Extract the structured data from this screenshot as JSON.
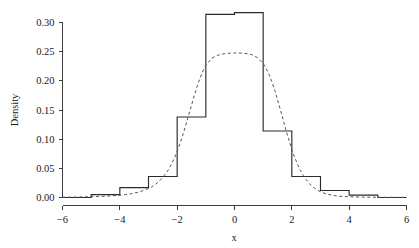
{
  "chart_data": {
    "type": "bar",
    "title": "",
    "subtitle": "",
    "xlabel": "x",
    "ylabel": "Density",
    "xlim": [
      -6,
      6
    ],
    "ylim": [
      0,
      0.33
    ],
    "grid": false,
    "legend": null,
    "xticks": [
      "−6",
      "−4",
      "−2",
      "0",
      "2",
      "4",
      "6"
    ],
    "xtick_values": [
      -6,
      -4,
      -2,
      0,
      2,
      4,
      6
    ],
    "yticks": [
      "0.00",
      "0.05",
      "0.10",
      "0.15",
      "0.20",
      "0.25",
      "0.30"
    ],
    "ytick_values": [
      0.0,
      0.05,
      0.1,
      0.15,
      0.2,
      0.25,
      0.3
    ],
    "histogram": {
      "name": "Density histogram",
      "bin_width": 1,
      "bin_edges": [
        -6,
        -5,
        -4,
        -3,
        -2,
        -1,
        0,
        1,
        2,
        3,
        4,
        5,
        6
      ],
      "bin_centers": [
        -5.5,
        -4.5,
        -3.5,
        -2.5,
        -1.5,
        -0.5,
        0.5,
        1.5,
        2.5,
        3.5,
        4.5,
        5.5
      ],
      "values": [
        0.0,
        0.005,
        0.017,
        0.036,
        0.138,
        0.314,
        0.317,
        0.114,
        0.036,
        0.012,
        0.004,
        0.0
      ]
    },
    "curve": {
      "name": "Fitted density curve",
      "style": "dashed",
      "peak_value": 0.248,
      "x": [
        -6.0,
        -5.5,
        -5.0,
        -4.5,
        -4.0,
        -3.8,
        -3.6,
        -3.4,
        -3.2,
        -3.0,
        -2.9,
        -2.8,
        -2.7,
        -2.6,
        -2.5,
        -2.4,
        -2.3,
        -2.2,
        -2.1,
        -2.0,
        -1.9,
        -1.8,
        -1.7,
        -1.6,
        -1.5,
        -1.4,
        -1.3,
        -1.2,
        -1.1,
        -1.0,
        -0.8,
        -0.6,
        -0.4,
        -0.2,
        0.0,
        0.2,
        0.4,
        0.6,
        0.8,
        1.0,
        1.1,
        1.2,
        1.3,
        1.4,
        1.5,
        1.6,
        1.7,
        1.8,
        1.9,
        2.0,
        2.1,
        2.2,
        2.3,
        2.4,
        2.5,
        2.6,
        2.7,
        2.8,
        2.9,
        3.0,
        3.2,
        3.4,
        3.6,
        3.8,
        4.0,
        4.5,
        5.0,
        5.5,
        6.0
      ],
      "y": [
        0.0005,
        0.0008,
        0.0013,
        0.0022,
        0.0038,
        0.005,
        0.0065,
        0.0086,
        0.0115,
        0.0155,
        0.018,
        0.021,
        0.0248,
        0.0292,
        0.0345,
        0.0408,
        0.0482,
        0.057,
        0.0672,
        0.079,
        0.0925,
        0.1075,
        0.124,
        0.141,
        0.158,
        0.175,
        0.191,
        0.205,
        0.217,
        0.2265,
        0.2385,
        0.2437,
        0.2462,
        0.2473,
        0.2477,
        0.2476,
        0.2469,
        0.2448,
        0.2398,
        0.2295,
        0.2215,
        0.2115,
        0.199,
        0.1845,
        0.168,
        0.1505,
        0.1325,
        0.1148,
        0.098,
        0.0825,
        0.0688,
        0.0568,
        0.0465,
        0.0378,
        0.0305,
        0.0245,
        0.0196,
        0.0156,
        0.0124,
        0.0098,
        0.0062,
        0.0039,
        0.0025,
        0.0017,
        0.0012,
        0.0006,
        0.0004,
        0.0003,
        0.0002
      ]
    }
  },
  "axes": {
    "y_label": "Density",
    "x_label": "x"
  },
  "colors": {
    "background": "#ffffff",
    "axis": "#3c3c3c",
    "bar_stroke": "#2b2b2b",
    "curve_stroke": "#555555",
    "text": "#1a1a1a"
  }
}
